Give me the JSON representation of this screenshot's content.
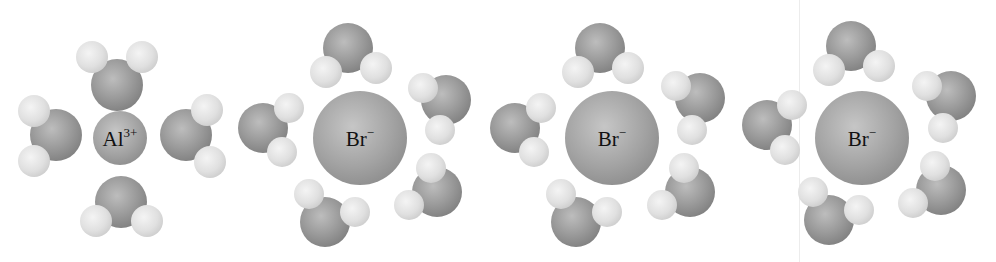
{
  "figure": {
    "colors": {
      "oxygen": "#8c8c8c",
      "hydrogen": "#e4e4e4",
      "ion": "#a3a3a3",
      "label": "#111111",
      "background": "#ffffff"
    },
    "clusters": [
      {
        "ion": {
          "symbol": "Al",
          "charge": "3+",
          "cx": 120,
          "cy": 138,
          "r": 27
        },
        "waters": [
          {
            "o": [
              117,
              85,
              26
            ],
            "h": [
              [
                92,
                57,
                16
              ],
              [
                142,
                57,
                16
              ]
            ]
          },
          {
            "o": [
              56,
              135,
              26
            ],
            "h": [
              [
                34,
                111,
                16
              ],
              [
                34,
                161,
                16
              ]
            ]
          },
          {
            "o": [
              186,
              135,
              26
            ],
            "h": [
              [
                207,
                110,
                16
              ],
              [
                210,
                162,
                16
              ]
            ]
          },
          {
            "o": [
              121,
              202,
              26
            ],
            "h": [
              [
                96,
                221,
                16
              ],
              [
                147,
                221,
                16
              ]
            ]
          }
        ]
      },
      {
        "ion": {
          "symbol": "Br",
          "charge": "−",
          "cx": 360,
          "cy": 138,
          "r": 47
        },
        "waters": [
          {
            "o": [
              348,
              48,
              25
            ],
            "h": [
              [
                326,
                72,
                16
              ],
              [
                376,
                68,
                16
              ]
            ]
          },
          {
            "o": [
              263,
              128,
              25
            ],
            "h": [
              [
                289,
                108,
                15
              ],
              [
                282,
                152,
                15
              ]
            ]
          },
          {
            "o": [
              446,
              100,
              25
            ],
            "h": [
              [
                423,
                88,
                15
              ],
              [
                440,
                130,
                15
              ]
            ]
          },
          {
            "o": [
              437,
              192,
              25
            ],
            "h": [
              [
                431,
                168,
                15
              ],
              [
                409,
                205,
                15
              ]
            ]
          },
          {
            "o": [
              325,
              222,
              25
            ],
            "h": [
              [
                309,
                194,
                15
              ],
              [
                355,
                212,
                15
              ]
            ]
          }
        ]
      },
      {
        "ion": {
          "symbol": "Br",
          "charge": "−",
          "cx": 612,
          "cy": 138,
          "r": 47
        },
        "waters": [
          {
            "o": [
              600,
              48,
              25
            ],
            "h": [
              [
                578,
                72,
                16
              ],
              [
                628,
                68,
                16
              ]
            ]
          },
          {
            "o": [
              515,
              128,
              25
            ],
            "h": [
              [
                541,
                108,
                15
              ],
              [
                534,
                152,
                15
              ]
            ]
          },
          {
            "o": [
              700,
              98,
              25
            ],
            "h": [
              [
                676,
                86,
                15
              ],
              [
                692,
                130,
                15
              ]
            ]
          },
          {
            "o": [
              690,
              192,
              25
            ],
            "h": [
              [
                684,
                168,
                15
              ],
              [
                662,
                205,
                15
              ]
            ]
          },
          {
            "o": [
              576,
              222,
              25
            ],
            "h": [
              [
                561,
                194,
                15
              ],
              [
                607,
                212,
                15
              ]
            ]
          }
        ]
      },
      {
        "ion": {
          "symbol": "Br",
          "charge": "−",
          "cx": 862,
          "cy": 138,
          "r": 47
        },
        "waters": [
          {
            "o": [
              851,
              46,
              25
            ],
            "h": [
              [
                829,
                70,
                16
              ],
              [
                879,
                66,
                16
              ]
            ]
          },
          {
            "o": [
              767,
              125,
              25
            ],
            "h": [
              [
                792,
                105,
                15
              ],
              [
                785,
                150,
                15
              ]
            ]
          },
          {
            "o": [
              951,
              96,
              25
            ],
            "h": [
              [
                927,
                86,
                15
              ],
              [
                943,
                128,
                15
              ]
            ]
          },
          {
            "o": [
              941,
              190,
              25
            ],
            "h": [
              [
                935,
                166,
                15
              ],
              [
                913,
                203,
                15
              ]
            ]
          },
          {
            "o": [
              829,
              220,
              25
            ],
            "h": [
              [
                813,
                192,
                15
              ],
              [
                859,
                210,
                15
              ]
            ]
          }
        ]
      }
    ]
  }
}
